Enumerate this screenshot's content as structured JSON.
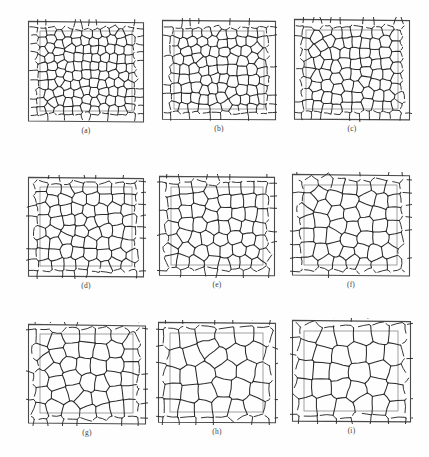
{
  "figure": {
    "kind": "micrograph-grid",
    "rows": 3,
    "columns": 3,
    "background_color": "#fefefe",
    "line_color": "#2b2b2b",
    "box_color": "#8a8a8a",
    "frame_color": "#4a4a4a"
  },
  "panels": [
    {
      "label": "(a)",
      "name": "panel-a",
      "x": 26,
      "y": 19,
      "w": 120,
      "h": 105,
      "frame_skew": -0.6,
      "box": {
        "x": 14,
        "y": 12,
        "w": 92,
        "h": 80
      },
      "seed": 11,
      "cell_count": 118,
      "cell_size": 8.4,
      "caption_y": 126
    },
    {
      "label": "(b)",
      "name": "panel-b",
      "x": 160,
      "y": 18,
      "w": 118,
      "h": 104,
      "frame_skew": -0.4,
      "box": {
        "x": 14,
        "y": 13,
        "w": 90,
        "h": 78
      },
      "seed": 22,
      "cell_count": 96,
      "cell_size": 9.3,
      "caption_y": 126
    },
    {
      "label": "(c)",
      "name": "panel-c",
      "x": 292,
      "y": 17,
      "w": 120,
      "h": 105,
      "frame_skew": -0.5,
      "box": {
        "x": 14,
        "y": 13,
        "w": 92,
        "h": 79
      },
      "seed": 33,
      "cell_count": 84,
      "cell_size": 10.1,
      "caption_y": 126
    },
    {
      "label": "(d)",
      "name": "panel-d",
      "x": 26,
      "y": 175,
      "w": 120,
      "h": 104,
      "frame_skew": -0.5,
      "box": {
        "x": 14,
        "y": 12,
        "w": 92,
        "h": 79
      },
      "seed": 44,
      "cell_count": 66,
      "cell_size": 11.6,
      "caption_y": 282
    },
    {
      "label": "(e)",
      "name": "panel-e",
      "x": 157,
      "y": 174,
      "w": 120,
      "h": 104,
      "frame_skew": -0.4,
      "box": {
        "x": 14,
        "y": 13,
        "w": 92,
        "h": 78
      },
      "seed": 55,
      "cell_count": 58,
      "cell_size": 12.4,
      "caption_y": 282
    },
    {
      "label": "(f)",
      "name": "panel-f",
      "x": 290,
      "y": 172,
      "w": 122,
      "h": 106,
      "frame_skew": -0.6,
      "box": {
        "x": 14,
        "y": 13,
        "w": 93,
        "h": 80
      },
      "seed": 66,
      "cell_count": 48,
      "cell_size": 13.6,
      "caption_y": 282
    },
    {
      "label": "(g)",
      "name": "panel-g",
      "x": 26,
      "y": 322,
      "w": 122,
      "h": 104,
      "frame_skew": -0.7,
      "box": {
        "x": 14,
        "y": 12,
        "w": 93,
        "h": 79
      },
      "seed": 77,
      "cell_count": 40,
      "cell_size": 15.0,
      "caption_y": 429
    },
    {
      "label": "(h)",
      "name": "panel-h",
      "x": 156,
      "y": 320,
      "w": 122,
      "h": 105,
      "frame_skew": -0.4,
      "box": {
        "x": 14,
        "y": 13,
        "w": 93,
        "h": 79
      },
      "seed": 88,
      "cell_count": 32,
      "cell_size": 16.8,
      "caption_y": 429
    },
    {
      "label": "(i)",
      "name": "panel-i",
      "x": 290,
      "y": 318,
      "w": 123,
      "h": 106,
      "frame_skew": -0.5,
      "box": {
        "x": 14,
        "y": 13,
        "w": 94,
        "h": 80
      },
      "seed": 99,
      "cell_count": 28,
      "cell_size": 18.0,
      "caption_y": 429
    }
  ]
}
